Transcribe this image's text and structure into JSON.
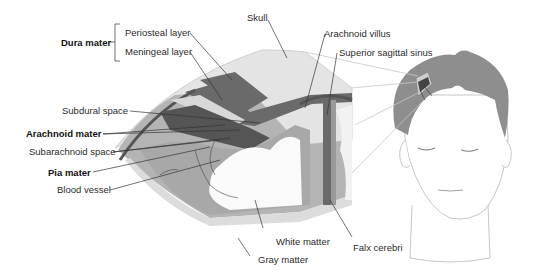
{
  "diagram": {
    "labels": {
      "dura_mater": "Dura mater",
      "periosteal_layer": "Periosteal layer",
      "meningeal_layer": "Meningeal layer",
      "skull": "Skull",
      "arachnoid_villus": "Arachnoid villus",
      "superior_sagittal_sinus": "Superior sagittal sinus",
      "subdural_space": "Subdural space",
      "arachnoid_mater": "Arachnoid mater",
      "subarachnoid_space": "Subarachnoid space",
      "pia_mater": "Pia mater",
      "blood_vessel": "Blood vessel",
      "white_matter": "White matter",
      "gray_matter": "Gray matter",
      "falx_cerebri": "Falx cerebri"
    },
    "colors": {
      "skull": "#e4e4e4",
      "dura": "#6a6a6a",
      "arachnoid": "#8c8c8c",
      "subdural": "#c8c8c8",
      "gray_matter": "#b4b4b4",
      "white_matter": "#fafafa",
      "hair": "#8e8e8e",
      "leader": "#333333"
    }
  }
}
